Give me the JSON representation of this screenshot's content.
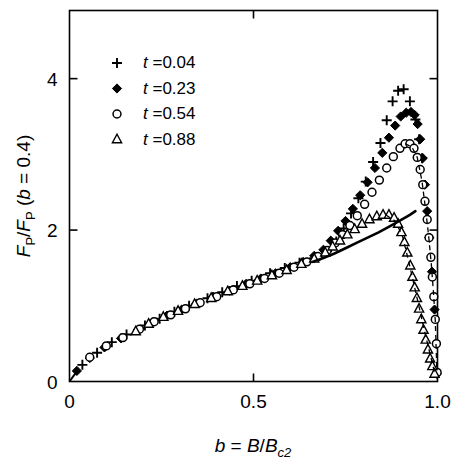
{
  "figure": {
    "background": "#ffffff",
    "ink": "#000000"
  },
  "axes": {
    "x": {
      "title_parts": {
        "var": "b",
        "eq": " = ",
        "num": "B",
        "slash": "/",
        "den": "B",
        "den_sub": "c2"
      },
      "title_text": "b = B/Bc2",
      "ticks": [
        {
          "value": 0,
          "label": "0"
        },
        {
          "value": 0.5,
          "label": "0.5"
        },
        {
          "value": 1.0,
          "label": "1.0"
        }
      ],
      "range": [
        0,
        1.0
      ]
    },
    "y": {
      "title_text": "FP/FP (b = 0.4)",
      "title_parts": {
        "f1": "F",
        "f1sub": "P",
        "slash": "/",
        "f2": "F",
        "f2sub": "P",
        "paren_open": " (",
        "bvar": "b",
        "eq": " = ",
        "bval": "0.4",
        "paren_close": ")"
      },
      "ticks": [
        {
          "value": 0,
          "label": "0"
        },
        {
          "value": 2,
          "label": "2"
        },
        {
          "value": 4,
          "label": "4"
        }
      ],
      "range": [
        0,
        4.9
      ]
    }
  },
  "legend": {
    "position": "upper-left",
    "entries": [
      {
        "marker": "plus-marker",
        "var": "t",
        "eq": " =",
        "value": "0.04",
        "label": "t =0.04"
      },
      {
        "marker": "filled-diamond-marker",
        "var": "t",
        "eq": " =",
        "value": "0.23",
        "label": "t =0.23"
      },
      {
        "marker": "open-circle-marker",
        "var": "t",
        "eq": " =",
        "value": "0.54",
        "label": "t =0.54"
      },
      {
        "marker": "open-triangle-marker",
        "var": "t",
        "eq": " =",
        "value": "0.88",
        "label": "t =0.88"
      }
    ]
  },
  "chart_data": {
    "type": "scatter",
    "title": "",
    "xlabel": "b = B/Bc2",
    "ylabel": "FP/FP (b = 0.4)",
    "xlim": [
      0,
      1.0
    ],
    "ylim": [
      0,
      4.9
    ],
    "grid": false,
    "legend_position": "upper-left",
    "series": [
      {
        "name": "t =0.04",
        "marker": "plus",
        "fill": "none",
        "color": "#000000",
        "points": [
          [
            0.035,
            0.22
          ],
          [
            0.075,
            0.38
          ],
          [
            0.115,
            0.52
          ],
          [
            0.155,
            0.62
          ],
          [
            0.205,
            0.74
          ],
          [
            0.245,
            0.83
          ],
          [
            0.285,
            0.92
          ],
          [
            0.325,
            1.0
          ],
          [
            0.375,
            1.1
          ],
          [
            0.415,
            1.18
          ],
          [
            0.455,
            1.26
          ],
          [
            0.495,
            1.33
          ],
          [
            0.545,
            1.43
          ],
          [
            0.585,
            1.5
          ],
          [
            0.625,
            1.57
          ],
          [
            0.665,
            1.63
          ],
          [
            0.7,
            1.72
          ],
          [
            0.725,
            1.85
          ],
          [
            0.745,
            2.02
          ],
          [
            0.765,
            2.22
          ],
          [
            0.785,
            2.42
          ],
          [
            0.805,
            2.64
          ],
          [
            0.825,
            2.9
          ],
          [
            0.845,
            3.15
          ],
          [
            0.862,
            3.45
          ],
          [
            0.878,
            3.7
          ],
          [
            0.893,
            3.84
          ],
          [
            0.908,
            3.86
          ],
          [
            0.925,
            3.7
          ],
          [
            0.94,
            3.46
          ],
          [
            0.95,
            3.2
          ],
          [
            0.958,
            2.95
          ]
        ]
      },
      {
        "name": "t =0.23",
        "marker": "diamond",
        "fill": "solid",
        "color": "#000000",
        "points": [
          [
            0.02,
            0.14
          ],
          [
            0.055,
            0.31
          ],
          [
            0.095,
            0.45
          ],
          [
            0.14,
            0.57
          ],
          [
            0.185,
            0.68
          ],
          [
            0.225,
            0.78
          ],
          [
            0.265,
            0.87
          ],
          [
            0.305,
            0.95
          ],
          [
            0.345,
            1.03
          ],
          [
            0.39,
            1.12
          ],
          [
            0.435,
            1.2
          ],
          [
            0.48,
            1.29
          ],
          [
            0.52,
            1.36
          ],
          [
            0.56,
            1.43
          ],
          [
            0.6,
            1.51
          ],
          [
            0.635,
            1.58
          ],
          [
            0.665,
            1.66
          ],
          [
            0.69,
            1.74
          ],
          [
            0.71,
            1.86
          ],
          [
            0.73,
            1.99
          ],
          [
            0.75,
            2.12
          ],
          [
            0.77,
            2.28
          ],
          [
            0.79,
            2.46
          ],
          [
            0.81,
            2.63
          ],
          [
            0.83,
            2.82
          ],
          [
            0.85,
            3.02
          ],
          [
            0.868,
            3.22
          ],
          [
            0.885,
            3.38
          ],
          [
            0.9,
            3.5
          ],
          [
            0.915,
            3.55
          ],
          [
            0.928,
            3.56
          ],
          [
            0.938,
            3.52
          ],
          [
            0.946,
            3.4
          ],
          [
            0.953,
            3.2
          ],
          [
            0.96,
            2.95
          ],
          [
            0.966,
            2.6
          ],
          [
            0.972,
            2.25
          ],
          [
            0.978,
            1.9
          ],
          [
            0.985,
            1.45
          ],
          [
            0.992,
            0.95
          ],
          [
            0.998,
            0.1
          ]
        ]
      },
      {
        "name": "t =0.54",
        "marker": "circle",
        "fill": "none",
        "color": "#000000",
        "points": [
          [
            0.055,
            0.32
          ],
          [
            0.1,
            0.47
          ],
          [
            0.145,
            0.58
          ],
          [
            0.19,
            0.69
          ],
          [
            0.23,
            0.79
          ],
          [
            0.275,
            0.88
          ],
          [
            0.315,
            0.96
          ],
          [
            0.355,
            1.04
          ],
          [
            0.4,
            1.12
          ],
          [
            0.445,
            1.21
          ],
          [
            0.49,
            1.29
          ],
          [
            0.53,
            1.36
          ],
          [
            0.57,
            1.43
          ],
          [
            0.61,
            1.51
          ],
          [
            0.645,
            1.58
          ],
          [
            0.675,
            1.65
          ],
          [
            0.7,
            1.73
          ],
          [
            0.722,
            1.83
          ],
          [
            0.742,
            1.94
          ],
          [
            0.762,
            2.06
          ],
          [
            0.782,
            2.19
          ],
          [
            0.802,
            2.34
          ],
          [
            0.822,
            2.5
          ],
          [
            0.842,
            2.66
          ],
          [
            0.862,
            2.82
          ],
          [
            0.88,
            2.97
          ],
          [
            0.898,
            3.08
          ],
          [
            0.912,
            3.14
          ],
          [
            0.925,
            3.14
          ],
          [
            0.936,
            3.08
          ],
          [
            0.945,
            2.96
          ],
          [
            0.953,
            2.8
          ],
          [
            0.96,
            2.6
          ],
          [
            0.966,
            2.38
          ],
          [
            0.972,
            2.14
          ],
          [
            0.977,
            1.9
          ],
          [
            0.982,
            1.64
          ],
          [
            0.986,
            1.38
          ],
          [
            0.99,
            1.12
          ],
          [
            0.994,
            0.82
          ],
          [
            0.997,
            0.5
          ],
          [
            0.999,
            0.12
          ]
        ]
      },
      {
        "name": "t =0.88",
        "marker": "triangle",
        "fill": "none",
        "color": "#000000",
        "points": [
          [
            0.18,
            0.66
          ],
          [
            0.215,
            0.76
          ],
          [
            0.255,
            0.85
          ],
          [
            0.295,
            0.93
          ],
          [
            0.34,
            1.02
          ],
          [
            0.385,
            1.1
          ],
          [
            0.43,
            1.19
          ],
          [
            0.47,
            1.26
          ],
          [
            0.51,
            1.33
          ],
          [
            0.55,
            1.4
          ],
          [
            0.59,
            1.47
          ],
          [
            0.63,
            1.55
          ],
          [
            0.665,
            1.62
          ],
          [
            0.695,
            1.7
          ],
          [
            0.715,
            1.78
          ],
          [
            0.735,
            1.86
          ],
          [
            0.755,
            1.94
          ],
          [
            0.775,
            2.01
          ],
          [
            0.795,
            2.08
          ],
          [
            0.815,
            2.14
          ],
          [
            0.835,
            2.18
          ],
          [
            0.852,
            2.2
          ],
          [
            0.868,
            2.2
          ],
          [
            0.882,
            2.16
          ],
          [
            0.893,
            2.08
          ],
          [
            0.902,
            1.97
          ],
          [
            0.91,
            1.84
          ],
          [
            0.918,
            1.7
          ],
          [
            0.926,
            1.53
          ],
          [
            0.932,
            1.38
          ],
          [
            0.938,
            1.24
          ],
          [
            0.944,
            1.1
          ],
          [
            0.95,
            0.96
          ],
          [
            0.956,
            0.82
          ],
          [
            0.962,
            0.68
          ],
          [
            0.968,
            0.55
          ],
          [
            0.974,
            0.42
          ],
          [
            0.98,
            0.3
          ],
          [
            0.986,
            0.2
          ],
          [
            0.992,
            0.1
          ]
        ]
      }
    ],
    "theory_curve": {
      "name": "solid-theory-curve",
      "style": "solid",
      "color": "#000000",
      "points": [
        [
          0.66,
          1.58
        ],
        [
          0.69,
          1.63
        ],
        [
          0.72,
          1.69
        ],
        [
          0.75,
          1.76
        ],
        [
          0.78,
          1.83
        ],
        [
          0.81,
          1.9
        ],
        [
          0.84,
          1.97
        ],
        [
          0.87,
          2.05
        ],
        [
          0.9,
          2.13
        ],
        [
          0.925,
          2.2
        ],
        [
          0.94,
          2.25
        ]
      ]
    },
    "guide_curves": [
      {
        "name": "dashed-guide-circle",
        "style": "dashed",
        "color": "#000000",
        "points": [
          [
            0.912,
            3.14
          ],
          [
            0.93,
            3.1
          ],
          [
            0.945,
            2.96
          ],
          [
            0.958,
            2.64
          ],
          [
            0.968,
            2.26
          ],
          [
            0.976,
            1.92
          ],
          [
            0.983,
            1.56
          ],
          [
            0.989,
            1.18
          ],
          [
            0.994,
            0.8
          ],
          [
            0.998,
            0.18
          ]
        ]
      },
      {
        "name": "dashed-guide-triangle",
        "style": "dashed",
        "color": "#000000",
        "points": [
          [
            0.86,
            2.2
          ],
          [
            0.885,
            2.12
          ],
          [
            0.905,
            1.92
          ],
          [
            0.922,
            1.58
          ],
          [
            0.938,
            1.24
          ],
          [
            0.952,
            0.94
          ],
          [
            0.966,
            0.64
          ],
          [
            0.98,
            0.36
          ],
          [
            0.992,
            0.12
          ]
        ]
      }
    ],
    "origin_curve": {
      "name": "origin-segment",
      "style": "solid",
      "points": [
        [
          0.0,
          0.0
        ],
        [
          0.012,
          0.08
        ],
        [
          0.025,
          0.16
        ]
      ]
    }
  }
}
